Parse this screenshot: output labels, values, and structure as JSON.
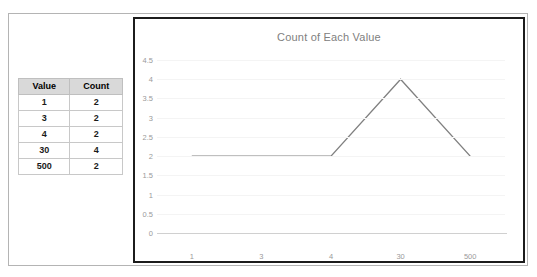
{
  "document": {
    "frame_border_color": "#b4b4b4",
    "background": "#ffffff"
  },
  "table": {
    "columns": [
      "Value",
      "Count"
    ],
    "rows": [
      [
        "1",
        "2"
      ],
      [
        "3",
        "2"
      ],
      [
        "4",
        "2"
      ],
      [
        "30",
        "4"
      ],
      [
        "500",
        "2"
      ]
    ],
    "header_fill": "#d9d9d9",
    "border_color": "#c8c8c8"
  },
  "chart": {
    "border_color": "#1c1c1c",
    "plot_background": "#ffffff",
    "title_color": "#808080",
    "tick_color": "#9a9a9a",
    "gridline_color": "#f4f4f4",
    "series_color": "#808080"
  },
  "chart_data": {
    "type": "line",
    "title": "Count of Each Value",
    "xlabel": "",
    "ylabel": "",
    "categories": [
      "1",
      "3",
      "4",
      "30",
      "500"
    ],
    "values": [
      2,
      2,
      2,
      4,
      2
    ],
    "series": [
      {
        "name": "Count",
        "values": [
          2,
          2,
          2,
          4,
          2
        ],
        "color": "#808080"
      }
    ],
    "ylim": [
      0,
      4.5
    ],
    "yticks": [
      "0",
      "0.5",
      "1",
      "1.5",
      "2",
      "2.5",
      "3",
      "3.5",
      "4",
      "4.5"
    ],
    "ytick_values": [
      0,
      0.5,
      1,
      1.5,
      2,
      2.5,
      3,
      3.5,
      4,
      4.5
    ],
    "xticks": [
      "1",
      "3",
      "4",
      "30",
      "500"
    ],
    "grid": true,
    "grid_axis": "y",
    "legend": false,
    "markers": false
  }
}
